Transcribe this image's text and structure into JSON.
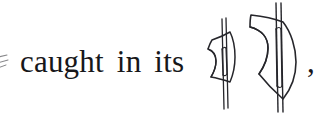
{
  "page": {
    "kind": "scanned-text-fragment",
    "background_color": "#ffffff",
    "ink_color": "#17171a",
    "width_px": 325,
    "height_px": 117
  },
  "line": {
    "full_text": "caught in its",
    "words": [
      {
        "text": "caught"
      },
      {
        "text": "in"
      },
      {
        "text": "its"
      }
    ],
    "trailing_punctuation": ","
  },
  "left_edge": {
    "description": "partial-cut-off-glyph",
    "visible": true
  },
  "figures": [
    {
      "id": "glyph-sail-small",
      "label": "sail-shape-with-pole",
      "stroke_color": "#26262b",
      "has_vertical_pole": true,
      "has_inner_slit": true,
      "pole_style": "double-line",
      "relative_size": "small"
    },
    {
      "id": "glyph-sail-large",
      "label": "sail-shape-with-pole",
      "stroke_color": "#26262b",
      "has_vertical_pole": true,
      "has_inner_slit": true,
      "pole_style": "double-line",
      "relative_size": "large"
    }
  ]
}
